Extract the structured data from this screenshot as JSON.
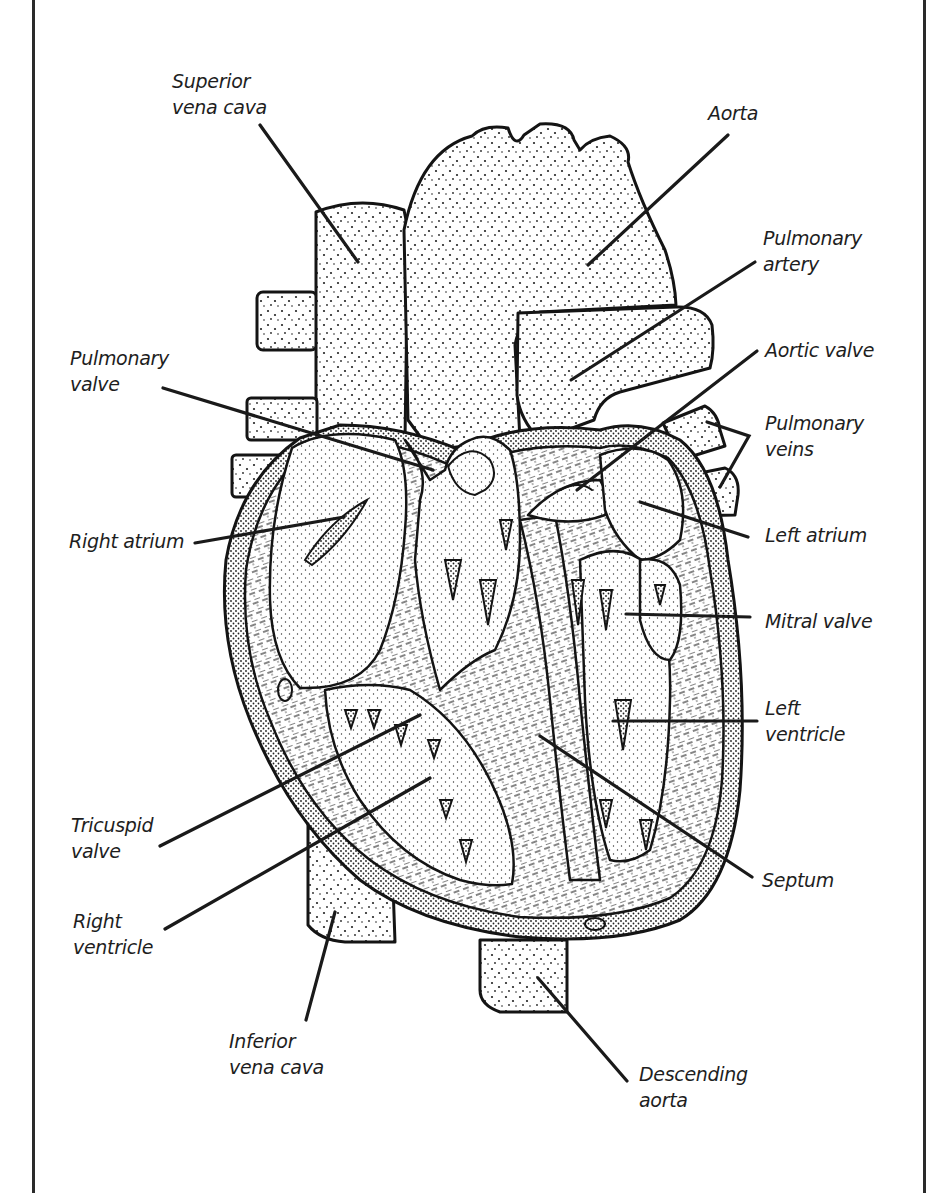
{
  "figure": {
    "colors": {
      "ink": "#1a1a1a",
      "background": "#ffffff"
    }
  },
  "labels": [
    {
      "id": "superior-vena-cava",
      "lines": [
        "Superior",
        "vena cava"
      ],
      "x": 172,
      "y": 88,
      "line": [
        260,
        125,
        358,
        262
      ]
    },
    {
      "id": "aorta",
      "lines": [
        "Aorta"
      ],
      "x": 708,
      "y": 120,
      "line": [
        728,
        135,
        588,
        265
      ]
    },
    {
      "id": "pulmonary-artery",
      "lines": [
        "Pulmonary",
        "artery"
      ],
      "x": 763,
      "y": 245,
      "line": [
        755,
        262,
        571,
        380
      ]
    },
    {
      "id": "pulmonary-valve",
      "lines": [
        "Pulmonary",
        "valve"
      ],
      "x": 70,
      "y": 365,
      "line": [
        163,
        388,
        433,
        470
      ]
    },
    {
      "id": "aortic-valve",
      "lines": [
        "Aortic valve"
      ],
      "x": 765,
      "y": 357,
      "line": [
        757,
        351,
        577,
        490
      ]
    },
    {
      "id": "pulmonary-veins",
      "lines": [
        "Pulmonary",
        "veins"
      ],
      "x": 765,
      "y": 430,
      "bracket": [
        [
          707,
          422
        ],
        [
          749,
          436
        ],
        [
          720,
          487
        ]
      ]
    },
    {
      "id": "right-atrium",
      "lines": [
        "Right atrium"
      ],
      "x": 69,
      "y": 548,
      "line": [
        195,
        543,
        344,
        517
      ]
    },
    {
      "id": "left-atrium",
      "lines": [
        "Left atrium"
      ],
      "x": 765,
      "y": 542,
      "line": [
        748,
        537,
        640,
        502
      ]
    },
    {
      "id": "mitral-valve",
      "lines": [
        "Mitral valve"
      ],
      "x": 765,
      "y": 628,
      "line": [
        750,
        617,
        626,
        614
      ]
    },
    {
      "id": "tricuspid-valve",
      "lines": [
        "Tricuspid",
        "valve"
      ],
      "x": 71,
      "y": 832,
      "line": [
        160,
        846,
        420,
        715
      ]
    },
    {
      "id": "left-ventricle",
      "lines": [
        "Left",
        "ventricle"
      ],
      "x": 765,
      "y": 715,
      "line": [
        757,
        721,
        613,
        721
      ]
    },
    {
      "id": "right-ventricle",
      "lines": [
        "Right",
        "ventricle"
      ],
      "x": 73,
      "y": 928,
      "line": [
        165,
        929,
        430,
        778
      ]
    },
    {
      "id": "septum",
      "lines": [
        "Septum"
      ],
      "x": 762,
      "y": 887,
      "line": [
        752,
        877,
        540,
        736
      ]
    },
    {
      "id": "inferior-vena-cava",
      "lines": [
        "Inferior",
        "vena cava"
      ],
      "x": 229,
      "y": 1048,
      "line": [
        306,
        1020,
        335,
        912
      ]
    },
    {
      "id": "descending-aorta",
      "lines": [
        "Descending",
        "aorta"
      ],
      "x": 639,
      "y": 1081,
      "line": [
        627,
        1081,
        538,
        978
      ]
    }
  ]
}
